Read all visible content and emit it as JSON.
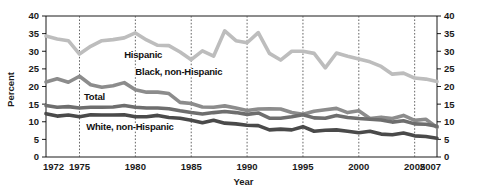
{
  "chart_data": {
    "type": "line",
    "title": "",
    "xlabel": "Year",
    "ylabel": "Percent",
    "xlim": [
      1972,
      2007
    ],
    "ylim": [
      0,
      40
    ],
    "grid": true,
    "legend_position": "inline-labels",
    "y_ticks": [
      0,
      5,
      10,
      15,
      20,
      25,
      30,
      35,
      40
    ],
    "y_ticks_right": [
      0,
      5,
      10,
      15,
      20,
      25,
      30,
      35,
      40
    ],
    "x_ticks": [
      1972,
      1975,
      1980,
      1985,
      1990,
      1995,
      2000,
      2005,
      2007
    ],
    "x_gridlines": [
      1975,
      1980,
      1985,
      1990,
      1995,
      2000,
      2005
    ],
    "x": [
      1972,
      1973,
      1974,
      1975,
      1976,
      1977,
      1978,
      1979,
      1980,
      1981,
      1982,
      1983,
      1984,
      1985,
      1986,
      1987,
      1988,
      1989,
      1990,
      1991,
      1992,
      1993,
      1994,
      1995,
      1996,
      1997,
      1998,
      1999,
      2000,
      2001,
      2002,
      2003,
      2004,
      2005,
      2006,
      2007
    ],
    "series": [
      {
        "name": "Hispanic",
        "color": "#bdbdbd",
        "label_x": 1979.0,
        "label_y": 29.0,
        "values": [
          34.3,
          33.5,
          33.0,
          29.2,
          31.4,
          33.0,
          33.3,
          33.8,
          35.2,
          33.2,
          31.7,
          31.6,
          29.8,
          27.6,
          30.1,
          28.6,
          35.8,
          33.0,
          32.4,
          35.3,
          29.4,
          27.5,
          30.0,
          30.0,
          29.4,
          25.3,
          29.5,
          28.6,
          27.8,
          27.0,
          25.7,
          23.5,
          23.8,
          22.4,
          22.1,
          21.4
        ]
      },
      {
        "name": "Black, non-Hispanic",
        "color": "#8c8c8c",
        "label_x": 1980.0,
        "label_y": 24.2,
        "values": [
          21.3,
          22.2,
          21.2,
          22.9,
          20.5,
          19.8,
          20.2,
          21.1,
          19.1,
          18.4,
          18.4,
          18.0,
          15.5,
          15.2,
          14.2,
          14.1,
          14.5,
          13.9,
          13.2,
          13.6,
          13.7,
          13.6,
          12.6,
          12.1,
          13.0,
          13.4,
          13.8,
          12.6,
          13.1,
          10.9,
          11.3,
          10.9,
          11.8,
          10.4,
          10.7,
          8.4
        ]
      },
      {
        "name": "Total",
        "color": "#6e6e6e",
        "label_x": 1975.4,
        "label_y": 17.1,
        "values": [
          14.6,
          14.1,
          14.3,
          13.9,
          14.1,
          14.1,
          14.2,
          14.6,
          14.1,
          13.9,
          13.9,
          13.7,
          13.1,
          12.6,
          12.2,
          12.6,
          12.9,
          12.6,
          12.1,
          12.5,
          11.0,
          11.0,
          11.4,
          12.0,
          11.1,
          11.0,
          11.8,
          11.2,
          10.9,
          10.7,
          10.5,
          9.9,
          10.3,
          9.4,
          9.3,
          8.7
        ]
      },
      {
        "name": "White, non-Hispanic",
        "color": "#4a4a4a",
        "label_x": 1975.6,
        "label_y": 8.6,
        "values": [
          12.3,
          11.6,
          11.9,
          11.4,
          12.0,
          11.9,
          11.9,
          12.0,
          11.4,
          11.4,
          11.8,
          11.2,
          11.0,
          10.4,
          9.7,
          10.4,
          9.6,
          9.4,
          9.0,
          8.9,
          7.7,
          7.9,
          7.7,
          8.6,
          7.3,
          7.6,
          7.7,
          7.3,
          6.9,
          7.3,
          6.5,
          6.3,
          6.8,
          6.0,
          5.8,
          5.3
        ]
      }
    ]
  }
}
